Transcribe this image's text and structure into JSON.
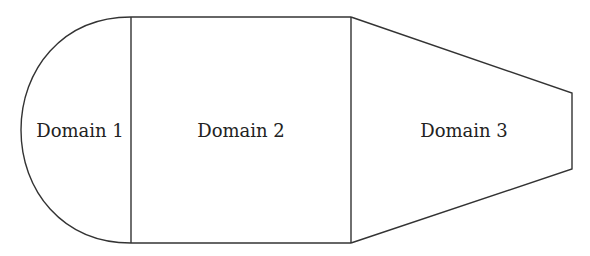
{
  "diagram": {
    "type": "domain-decomposition",
    "line_color": "#333333",
    "background": "#ffffff",
    "domains": [
      {
        "id": 1,
        "label": "Domain 1",
        "shape": "half-disk"
      },
      {
        "id": 2,
        "label": "Domain 2",
        "shape": "rectangle"
      },
      {
        "id": 3,
        "label": "Domain 3",
        "shape": "trapezoid"
      }
    ]
  }
}
